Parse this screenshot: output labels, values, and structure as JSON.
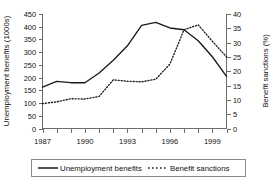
{
  "chart_data": {
    "type": "line",
    "title": "",
    "xlabel": "",
    "x": [
      1987,
      1988,
      1989,
      1990,
      1991,
      1992,
      1993,
      1994,
      1995,
      1996,
      1997,
      1998,
      1999,
      2000
    ],
    "xtick_labels": [
      "1987",
      "1990",
      "1993",
      "1996",
      "1999"
    ],
    "xtick_years": [
      1987,
      1990,
      1993,
      1996,
      1999
    ],
    "xlim": [
      1987,
      2000
    ],
    "grid": false,
    "legend_position": "bottom",
    "series": [
      {
        "name": "Unemployment benefits",
        "axis": "left",
        "style": "solid",
        "unit": "1000s",
        "values": [
          163,
          185,
          180,
          180,
          218,
          268,
          325,
          405,
          417,
          395,
          388,
          345,
          282,
          205
        ]
      },
      {
        "name": "Benefit sanctions",
        "axis": "right",
        "style": "dotted",
        "unit": "%",
        "values": [
          8.7,
          9.3,
          10.4,
          10.3,
          11.2,
          17.0,
          16.5,
          16.3,
          17.2,
          22.5,
          34.5,
          36.2,
          30.5,
          25.0
        ]
      }
    ],
    "left_axis": {
      "label": "Unemployment benefits (1000s)",
      "ylim": [
        0,
        450
      ],
      "tick_step": 50,
      "ticks": [
        0,
        50,
        100,
        150,
        200,
        250,
        300,
        350,
        400,
        450
      ],
      "tick_labels": [
        "0",
        "50",
        "100",
        "150",
        "200",
        "250",
        "300",
        "350",
        "400",
        "450"
      ]
    },
    "right_axis": {
      "label": "Benefit sanctions (%)",
      "ylim": [
        0,
        40
      ],
      "tick_step": 5,
      "ticks": [
        0,
        5,
        10,
        15,
        20,
        25,
        30,
        35,
        40
      ],
      "tick_labels": [
        "0",
        "5",
        "10",
        "15",
        "20",
        "25",
        "30",
        "35",
        "40"
      ]
    },
    "legend": [
      {
        "label": "Unemployment benefits",
        "style": "solid"
      },
      {
        "label": "Benefit sanctions",
        "style": "dotted"
      }
    ],
    "colors": {
      "series": "#1a1a1a",
      "axis": "#6b6b6b",
      "legend_border": "#8a8a8a",
      "background": "#ffffff"
    }
  }
}
